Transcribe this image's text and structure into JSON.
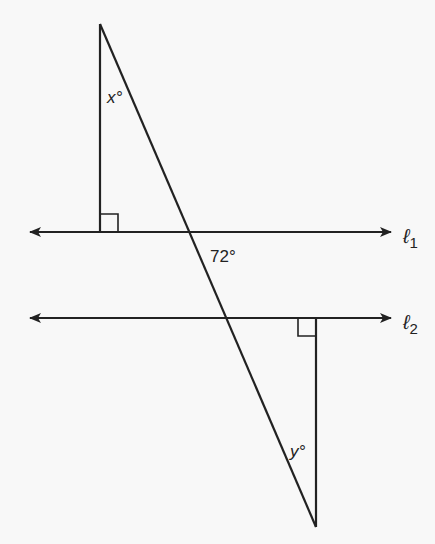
{
  "diagram": {
    "colors": {
      "stroke": "#222222",
      "background": "#f8f8f8"
    },
    "lines": {
      "l1": {
        "label": "ℓ",
        "subscript": "1"
      },
      "l2": {
        "label": "ℓ",
        "subscript": "2"
      }
    },
    "angles": {
      "x": {
        "label": "x°"
      },
      "given": {
        "label": "72°"
      },
      "y": {
        "label": "y°"
      }
    },
    "right_angle_marks": 2
  }
}
